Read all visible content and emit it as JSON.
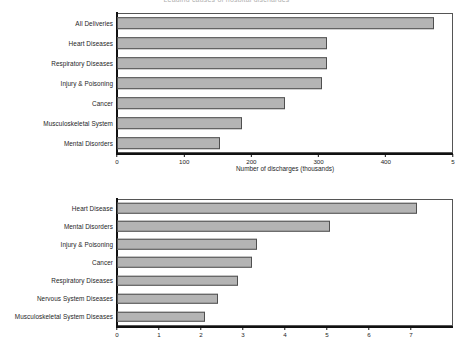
{
  "charts": [
    {
      "id": "chart-1",
      "title": "Leading causes of hospital discharges",
      "chart_data": {
        "type": "bar",
        "orientation": "horizontal",
        "title": "Leading causes of hospital discharges",
        "xlabel": "Number of discharges (thousands)",
        "ylabel": "",
        "xlim": [
          0,
          500
        ],
        "xticks": [
          0,
          100,
          200,
          300,
          400,
          500
        ],
        "xticklabels": [
          "0",
          "100",
          "200",
          "300",
          "400",
          "5"
        ],
        "grid": false,
        "legend": null,
        "categories": [
          "All Deliveries",
          "Heart Diseases",
          "Respiratory Diseases",
          "Injury & Poisoning",
          "Cancer",
          "Musculoskeletal System",
          "Mental Disorders"
        ],
        "values": [
          472,
          312,
          312,
          305,
          250,
          186,
          154
        ],
        "bar_color": "#b4b4b4",
        "bar_edge_color": "#4f4f4f"
      }
    },
    {
      "id": "chart-2",
      "title": "",
      "chart_data": {
        "type": "bar",
        "orientation": "horizontal",
        "title": "",
        "xlabel": "",
        "ylabel": "",
        "xlim": [
          0,
          8
        ],
        "xticks": [
          0,
          1,
          2,
          3,
          4,
          5,
          6,
          7
        ],
        "xticklabels": [
          "0",
          "1",
          "2",
          "3",
          "4",
          "5",
          "6",
          "7"
        ],
        "grid": false,
        "legend": null,
        "categories": [
          "Heart Disease",
          "Mental Disorders",
          "Injury & Poisoning",
          "Cancer",
          "Respiratory Diseases",
          "Nervous System Diseases",
          "Musculoskeletal System Diseases"
        ],
        "values": [
          7.15,
          5.07,
          3.33,
          3.21,
          2.88,
          2.4,
          2.1
        ],
        "bar_color": "#b4b4b4",
        "bar_edge_color": "#4f4f4f"
      }
    }
  ]
}
